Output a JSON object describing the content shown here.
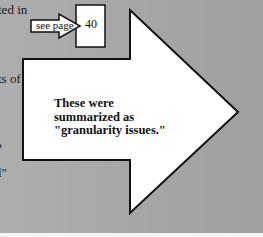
{
  "background": {
    "color": "#a9a9a9",
    "pattern": "halftone-gray"
  },
  "edge_text": [
    {
      "text": "ted in",
      "top": 2
    },
    {
      "text": "ts of",
      "top": 71
    },
    {
      "text": "?",
      "top": 140
    },
    {
      "text": "l\"",
      "top": 165
    }
  ],
  "small_arrow": {
    "label": "see page",
    "icon": "right-arrow-icon"
  },
  "page_box": {
    "value": "40"
  },
  "big_arrow": {
    "icon": "big-right-arrow-icon",
    "lines": [
      "These were",
      "summarized as",
      "\"granularity issues.\""
    ]
  }
}
